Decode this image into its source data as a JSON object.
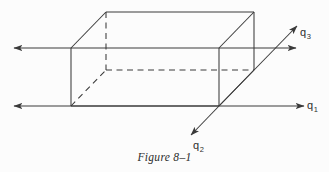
{
  "figure": {
    "caption": "Figure 8–1",
    "background_color": "#fcfcfc",
    "line_color": "#3a3a3a",
    "text_color": "#2e2e2e"
  },
  "labels": {
    "q1": {
      "base": "q",
      "sub": "1"
    },
    "q2": {
      "base": "q",
      "sub": "2"
    },
    "q3": {
      "base": "q",
      "sub": "3"
    }
  },
  "diagram": {
    "type": "3d-rectangular-box-with-heat-flux-vectors",
    "box": {
      "front_face": {
        "left": 71,
        "top": 48,
        "right": 219,
        "bottom": 106
      },
      "depth_offset": {
        "dx": 35,
        "dy": -36
      },
      "back_face": {
        "left": 106,
        "top": 12,
        "right": 254,
        "bottom": 70
      },
      "solid_edges": [
        [
          71,
          48,
          219,
          48
        ],
        [
          71,
          48,
          71,
          106
        ],
        [
          71,
          106,
          219,
          106
        ],
        [
          219,
          48,
          219,
          106
        ],
        [
          71,
          48,
          106,
          12
        ],
        [
          106,
          12,
          254,
          12
        ],
        [
          219,
          48,
          254,
          12
        ],
        [
          254,
          12,
          254,
          70
        ],
        [
          219,
          106,
          254,
          70
        ]
      ],
      "dashed_edges": [
        [
          106,
          12,
          106,
          70
        ],
        [
          106,
          70,
          254,
          70
        ],
        [
          71,
          106,
          106,
          70
        ]
      ]
    },
    "arrows": [
      {
        "name": "flux-left-upper",
        "from": [
          71,
          48
        ],
        "to": [
          13,
          48
        ],
        "head": "end"
      },
      {
        "name": "flux-left-lower",
        "from": [
          71,
          106
        ],
        "to": [
          13,
          106
        ],
        "head": "end"
      },
      {
        "name": "flux-right-upper",
        "from": [
          219,
          48
        ],
        "to": [
          297,
          48
        ],
        "head": "end"
      },
      {
        "name": "flux-right-lower-q1",
        "from": [
          71,
          106
        ],
        "to": [
          305,
          106
        ],
        "head": "end"
      },
      {
        "name": "flux-diagonal-q2-q3",
        "from": [
          190,
          136
        ],
        "to": [
          298,
          25
        ],
        "head": "both"
      }
    ]
  }
}
